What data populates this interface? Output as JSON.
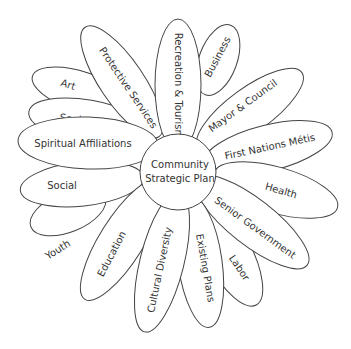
{
  "diagram": {
    "center": {
      "line1": "Community",
      "line2": "Strategic Plan"
    },
    "petals": [
      {
        "label": "Art"
      },
      {
        "label": "Seniors"
      },
      {
        "label": "Spiritual Affiliations"
      },
      {
        "label": "Social"
      },
      {
        "label": "Youth"
      },
      {
        "label": "Education"
      },
      {
        "label": "Cultural Diversity"
      },
      {
        "label": "Existing Plans"
      },
      {
        "label": "Labor"
      },
      {
        "label": "Senior Government"
      },
      {
        "label": "Health"
      },
      {
        "label": "First Nations Métis"
      },
      {
        "label": "Mayor & Council"
      },
      {
        "label": "Business"
      },
      {
        "label": "Recreation & Tourism"
      },
      {
        "label": "Protective Services"
      }
    ]
  }
}
